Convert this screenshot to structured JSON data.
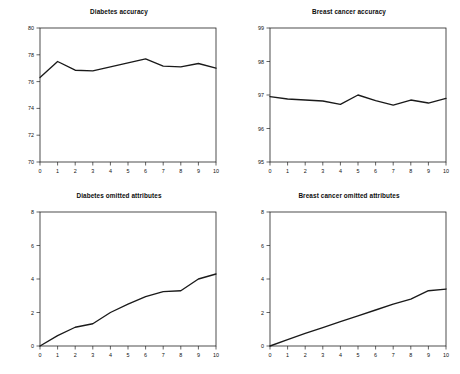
{
  "figure": {
    "width": 460,
    "height": 374,
    "background": "#ffffff",
    "line_color": "#1a1a1a",
    "axis_color": "#222222",
    "text_color": "#111111"
  },
  "chart_data": [
    {
      "id": "diabetes-accuracy",
      "type": "line",
      "title": "Diabetes accuracy",
      "xlabel": "",
      "ylabel": "",
      "x": [
        0,
        1,
        2,
        3,
        4,
        5,
        6,
        7,
        8,
        9,
        10
      ],
      "values": [
        76.3,
        77.5,
        76.85,
        76.8,
        77.1,
        77.4,
        77.7,
        77.15,
        77.1,
        77.35,
        77.0
      ],
      "xlim": [
        0,
        10
      ],
      "ylim": [
        70,
        80
      ],
      "xticks": [
        0,
        1,
        2,
        3,
        4,
        5,
        6,
        7,
        8,
        9,
        10
      ],
      "yticks": [
        70,
        72,
        74,
        76,
        78,
        80
      ],
      "xticklabels": [
        "0",
        "1",
        "2",
        "3",
        "4",
        "5",
        "6",
        "7",
        "8",
        "9",
        "10"
      ],
      "yticklabels": [
        "70",
        "72",
        "74",
        "76",
        "78",
        "80"
      ],
      "grid": false,
      "legend": false
    },
    {
      "id": "breast-cancer-accuracy",
      "type": "line",
      "title": "Breast cancer accuracy",
      "xlabel": "",
      "ylabel": "",
      "x": [
        0,
        1,
        2,
        3,
        4,
        5,
        6,
        7,
        8,
        9,
        10
      ],
      "values": [
        96.95,
        96.88,
        96.85,
        96.82,
        96.72,
        97.0,
        96.83,
        96.7,
        96.85,
        96.76,
        96.9
      ],
      "xlim": [
        0,
        10
      ],
      "ylim": [
        95,
        99
      ],
      "xticks": [
        0,
        1,
        2,
        3,
        4,
        5,
        6,
        7,
        8,
        9,
        10
      ],
      "yticks": [
        95,
        96,
        97,
        98,
        99
      ],
      "xticklabels": [
        "0",
        "1",
        "2",
        "3",
        "4",
        "5",
        "6",
        "7",
        "8",
        "9",
        "10"
      ],
      "yticklabels": [
        "95",
        "96",
        "97",
        "98",
        "99"
      ],
      "grid": false,
      "legend": false
    },
    {
      "id": "diabetes-omitted-attributes",
      "type": "line",
      "title": "Diabetes omitted attributes",
      "xlabel": "",
      "ylabel": "",
      "x": [
        0,
        1,
        2,
        3,
        4,
        5,
        6,
        7,
        8,
        9,
        10
      ],
      "values": [
        0.0,
        0.62,
        1.12,
        1.33,
        2.0,
        2.5,
        2.95,
        3.25,
        3.3,
        4.0,
        4.3
      ],
      "xlim": [
        0,
        10
      ],
      "ylim": [
        0,
        8
      ],
      "xticks": [
        0,
        1,
        2,
        3,
        4,
        5,
        6,
        7,
        8,
        9,
        10
      ],
      "yticks": [
        0,
        2,
        4,
        6,
        8
      ],
      "xticklabels": [
        "0",
        "1",
        "2",
        "3",
        "4",
        "5",
        "6",
        "7",
        "8",
        "9",
        "10"
      ],
      "yticklabels": [
        "0",
        "2",
        "4",
        "6",
        "8"
      ],
      "grid": false,
      "legend": false
    },
    {
      "id": "breast-cancer-omitted-attributes",
      "type": "line",
      "title": "Breast cancer omitted attributes",
      "xlabel": "",
      "ylabel": "",
      "x": [
        0,
        1,
        2,
        3,
        4,
        5,
        6,
        7,
        8,
        9,
        10
      ],
      "values": [
        0.0,
        0.38,
        0.75,
        1.1,
        1.45,
        1.8,
        2.15,
        2.5,
        2.8,
        3.3,
        3.4
      ],
      "xlim": [
        0,
        10
      ],
      "ylim": [
        0,
        8
      ],
      "xticks": [
        0,
        1,
        2,
        3,
        4,
        5,
        6,
        7,
        8,
        9,
        10
      ],
      "yticks": [
        0,
        2,
        4,
        6,
        8
      ],
      "xticklabels": [
        "0",
        "1",
        "2",
        "3",
        "4",
        "5",
        "6",
        "7",
        "8",
        "9",
        "10"
      ],
      "yticklabels": [
        "0",
        "2",
        "4",
        "6",
        "8"
      ],
      "grid": false,
      "legend": false
    }
  ],
  "panels": [
    {
      "id": "diabetes-accuracy",
      "left": 8,
      "top": 8,
      "width": 222,
      "height": 182
    },
    {
      "id": "breast-cancer-accuracy",
      "left": 238,
      "top": 8,
      "width": 222,
      "height": 182
    },
    {
      "id": "diabetes-omitted-attributes",
      "left": 8,
      "top": 192,
      "width": 222,
      "height": 182
    },
    {
      "id": "breast-cancer-omitted-attributes",
      "left": 238,
      "top": 192,
      "width": 222,
      "height": 182
    }
  ]
}
